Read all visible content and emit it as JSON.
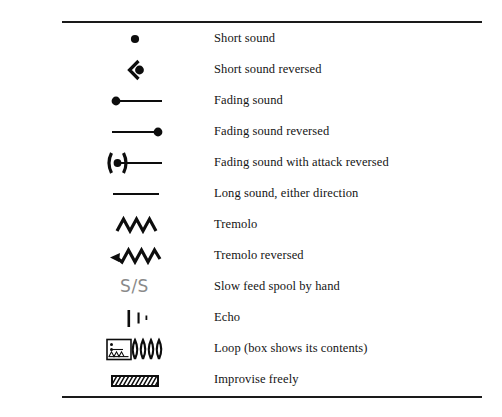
{
  "document": {
    "kind": "notation-legend-table",
    "rules": {
      "top": true,
      "bottom": true
    },
    "ink_color": "#0d0d0d",
    "paper_color": "#ffffff",
    "muted_color": "#8a8a8a"
  },
  "legend": {
    "rows": [
      {
        "icon": "filled-dot-symbol",
        "label": "Short sound"
      },
      {
        "icon": "dot-with-left-chevron-symbol",
        "label": "Short sound reversed"
      },
      {
        "icon": "dot-then-line-symbol",
        "label": "Fading sound"
      },
      {
        "icon": "line-then-dot-symbol",
        "label": "Fading sound reversed"
      },
      {
        "icon": "parenthesized-dot-then-line-symbol",
        "label": "Fading sound with attack reversed"
      },
      {
        "icon": "plain-line-symbol",
        "label": "Long sound, either direction"
      },
      {
        "icon": "zigzag-symbol",
        "label": "Tremolo"
      },
      {
        "icon": "zigzag-with-left-arrow-symbol",
        "label": "Tremolo reversed"
      },
      {
        "icon": "s-slash-s-text-symbol",
        "label": "Slow feed spool by hand",
        "text": "S/S"
      },
      {
        "icon": "echo-bars-symbol",
        "label": "Echo"
      },
      {
        "icon": "box-with-coil-symbol",
        "label": "Loop (box shows its contents)"
      },
      {
        "icon": "hatched-box-symbol",
        "label": "Improvise freely"
      }
    ]
  }
}
